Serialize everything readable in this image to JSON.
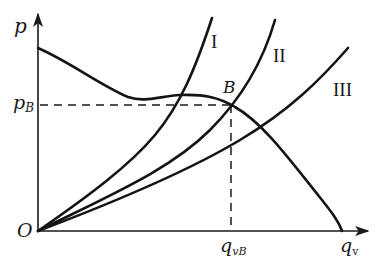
{
  "diagram": {
    "type": "pump-system-curves",
    "axes": {
      "y_label": "p",
      "x_label_main": "q",
      "x_label_sub": "v",
      "origin_label": "O"
    },
    "operating_point": {
      "label": "B",
      "p_label_main": "p",
      "p_label_sub": "B",
      "q_label_main": "q",
      "q_label_sub": "vB"
    },
    "curves": [
      {
        "id": "pump",
        "label": ""
      },
      {
        "id": "system-1",
        "label": "I"
      },
      {
        "id": "system-2",
        "label": "II"
      },
      {
        "id": "system-3",
        "label": "III"
      }
    ],
    "colors": {
      "line": "#141414",
      "background": "#ffffff"
    }
  }
}
